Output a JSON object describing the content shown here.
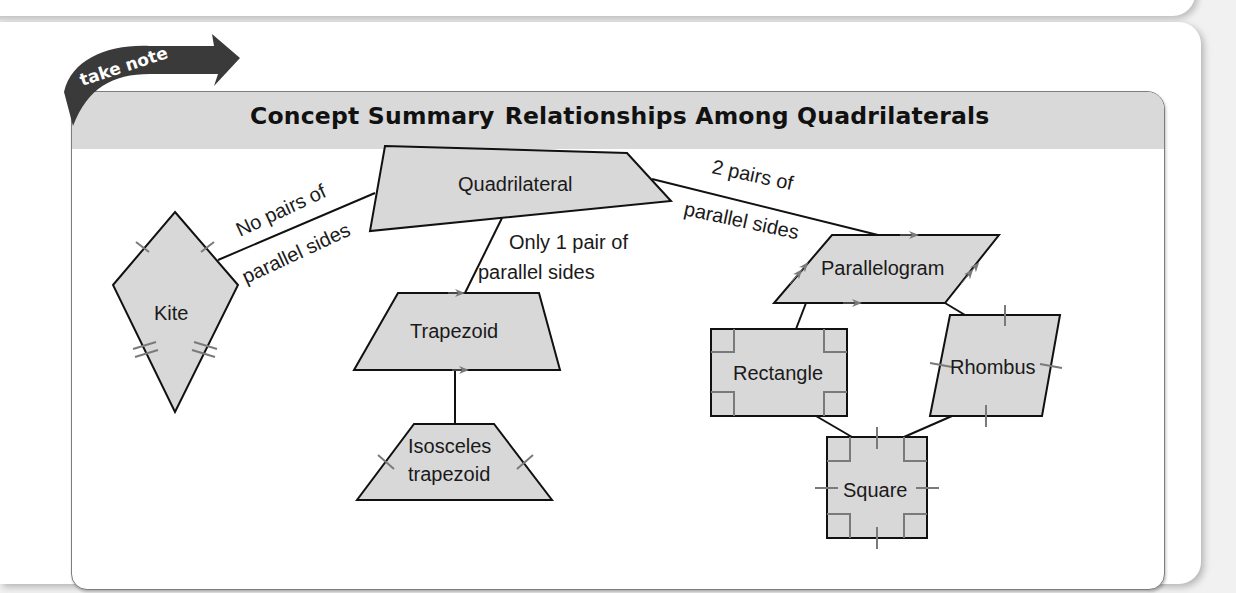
{
  "badge": {
    "text": "take note"
  },
  "header": {
    "title_prefix": "Concept Summary",
    "title": "Relationships Among Quadrilaterals"
  },
  "shapes": {
    "quadrilateral": "Quadrilateral",
    "kite": "Kite",
    "trapezoid": "Trapezoid",
    "isosceles_line1": "Isosceles",
    "isosceles_line2": "trapezoid",
    "parallelogram": "Parallelogram",
    "rectangle": "Rectangle",
    "rhombus": "Rhombus",
    "square": "Square"
  },
  "edges": {
    "no_pairs_line1": "No pairs of",
    "no_pairs_line2": "parallel sides",
    "one_pair_line1": "Only 1 pair of",
    "one_pair_line2": "parallel sides",
    "two_pairs_line1": "2 pairs of",
    "two_pairs_line2": "parallel sides"
  },
  "colors": {
    "shape_fill": "#d8d8d8",
    "header_fill": "#d9d9d9",
    "badge_fill": "#3a3a3a",
    "marks": "#7a7a7a"
  }
}
